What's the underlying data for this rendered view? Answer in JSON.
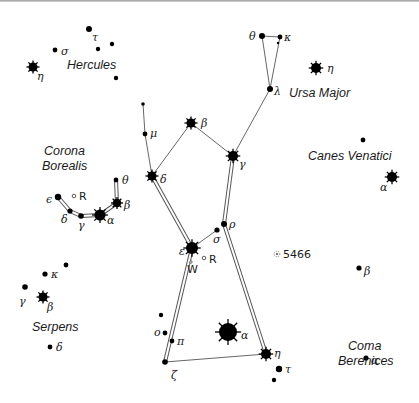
{
  "map": {
    "constellation_labels": [
      {
        "text": "Hercules",
        "x": 67,
        "y": 69
      },
      {
        "text": "Ursa Major",
        "x": 289,
        "y": 97
      },
      {
        "text": "Corona",
        "x": 44,
        "y": 155
      },
      {
        "text": "Borealis",
        "x": 42,
        "y": 170
      },
      {
        "text": "Canes Venatici",
        "x": 308,
        "y": 160
      },
      {
        "text": "Serpens",
        "x": 32,
        "y": 331
      },
      {
        "text": "Coma",
        "x": 348,
        "y": 350
      },
      {
        "text": "Berenices",
        "x": 338,
        "y": 365
      }
    ],
    "stars": [
      {
        "id": "her-tau",
        "x": 89,
        "y": 29,
        "r": 3,
        "label": "τ",
        "lx": 92,
        "ly": 41
      },
      {
        "id": "her-sigma",
        "x": 55,
        "y": 50,
        "r": 2.4,
        "label": "σ",
        "lx": 61,
        "ly": 55
      },
      {
        "id": "her-a",
        "x": 98,
        "y": 49,
        "r": 2.2,
        "label": "",
        "lx": 0,
        "ly": 0
      },
      {
        "id": "her-b",
        "x": 112,
        "y": 44,
        "r": 2.2,
        "label": "",
        "lx": 0,
        "ly": 0
      },
      {
        "id": "her-c",
        "x": 116,
        "y": 78,
        "r": 2.2,
        "label": "",
        "lx": 0,
        "ly": 0
      },
      {
        "id": "her-eta",
        "x": 33,
        "y": 67,
        "r": 4.5,
        "bright": true,
        "label": "η",
        "lx": 37,
        "ly": 80
      },
      {
        "id": "uma-theta",
        "x": 262,
        "y": 36,
        "r": 3,
        "label": "θ",
        "lx": 249,
        "ly": 40
      },
      {
        "id": "uma-kappa",
        "x": 280,
        "y": 37,
        "r": 2.4,
        "label": "κ",
        "lx": 284,
        "ly": 41
      },
      {
        "id": "uma-double",
        "x": 278,
        "y": 43,
        "r": 1.2,
        "label": "",
        "lx": 0,
        "ly": 0
      },
      {
        "id": "uma-lambda",
        "x": 270,
        "y": 89,
        "r": 3,
        "label": "λ",
        "lx": 274,
        "ly": 95
      },
      {
        "id": "uma-eta",
        "x": 316,
        "y": 68,
        "r": 5,
        "bright": true,
        "label": "η",
        "lx": 327,
        "ly": 72
      },
      {
        "id": "boo-top",
        "x": 143,
        "y": 104,
        "r": 1.8,
        "label": "",
        "lx": 0,
        "ly": 0
      },
      {
        "id": "boo-mu",
        "x": 145,
        "y": 134,
        "r": 2.4,
        "label": "μ",
        "lx": 150,
        "ly": 137
      },
      {
        "id": "boo-beta",
        "x": 191,
        "y": 123,
        "r": 4.5,
        "bright": true,
        "label": "β",
        "lx": 201,
        "ly": 127
      },
      {
        "id": "boo-gamma",
        "x": 233,
        "y": 156,
        "r": 5,
        "bright": true,
        "label": "γ",
        "lx": 239,
        "ly": 168
      },
      {
        "id": "boo-delta",
        "x": 152,
        "y": 176,
        "r": 4.5,
        "bright": true,
        "label": "δ",
        "lx": 160,
        "ly": 183
      },
      {
        "id": "boo-rho",
        "x": 224,
        "y": 224,
        "r": 3,
        "label": "ρ",
        "lx": 229,
        "ly": 228
      },
      {
        "id": "boo-sigma",
        "x": 217,
        "y": 230,
        "r": 2.6,
        "label": "σ",
        "lx": 213,
        "ly": 243
      },
      {
        "id": "boo-epsilon",
        "x": 192,
        "y": 248,
        "r": 6,
        "bright": true,
        "label": "ε",
        "lx": 179,
        "ly": 255
      },
      {
        "id": "boo-omicron",
        "x": 165,
        "y": 333,
        "r": 2.4,
        "label": "ο",
        "lx": 154,
        "ly": 336
      },
      {
        "id": "boo-pi",
        "x": 172,
        "y": 341,
        "r": 2.4,
        "label": "π",
        "lx": 177,
        "ly": 345
      },
      {
        "id": "boo-x",
        "x": 161,
        "y": 315,
        "r": 2.2,
        "label": "",
        "lx": 0,
        "ly": 0
      },
      {
        "id": "boo-zeta",
        "x": 165,
        "y": 362,
        "r": 2.8,
        "label": "ζ",
        "lx": 171,
        "ly": 379
      },
      {
        "id": "boo-alpha",
        "x": 228,
        "y": 332,
        "r": 9,
        "bright": true,
        "label": "α",
        "lx": 241,
        "ly": 339
      },
      {
        "id": "boo-eta",
        "x": 266,
        "y": 354,
        "r": 5,
        "bright": true,
        "label": "η",
        "lx": 274,
        "ly": 357
      },
      {
        "id": "boo-tau",
        "x": 279,
        "y": 369,
        "r": 3.2,
        "label": "τ",
        "lx": 285,
        "ly": 373
      },
      {
        "id": "boo-upsilon",
        "x": 274,
        "y": 380,
        "r": 2.2,
        "label": "",
        "lx": 0,
        "ly": 0
      },
      {
        "id": "crb-theta",
        "x": 116,
        "y": 180,
        "r": 2.4,
        "label": "θ",
        "lx": 122,
        "ly": 184
      },
      {
        "id": "crb-beta",
        "x": 117,
        "y": 203,
        "r": 4.2,
        "bright": true,
        "label": "β",
        "lx": 124,
        "ly": 209
      },
      {
        "id": "crb-alpha",
        "x": 100,
        "y": 215,
        "r": 5.5,
        "bright": true,
        "label": "α",
        "lx": 107,
        "ly": 224
      },
      {
        "id": "crb-gamma",
        "x": 81,
        "y": 216,
        "r": 2.8,
        "label": "γ",
        "lx": 78,
        "ly": 229
      },
      {
        "id": "crb-delta",
        "x": 70,
        "y": 211,
        "r": 2.6,
        "label": "δ",
        "lx": 61,
        "ly": 223
      },
      {
        "id": "crb-epsilon",
        "x": 58,
        "y": 197,
        "r": 3.2,
        "label": "ϵ",
        "lx": 46,
        "ly": 203
      },
      {
        "id": "cvn-top",
        "x": 363,
        "y": 140,
        "r": 2.4,
        "label": "",
        "lx": 0,
        "ly": 0
      },
      {
        "id": "cvn-alpha",
        "x": 392,
        "y": 177,
        "r": 5,
        "bright": true,
        "label": "α",
        "lx": 380,
        "ly": 191
      },
      {
        "id": "com-beta",
        "x": 359,
        "y": 268,
        "r": 2.6,
        "label": "β",
        "lx": 364,
        "ly": 275
      },
      {
        "id": "com-alpha",
        "x": 366,
        "y": 358,
        "r": 2.6,
        "label": "α",
        "lx": 371,
        "ly": 364
      },
      {
        "id": "ser-a",
        "x": 66,
        "y": 265,
        "r": 2.4,
        "label": "",
        "lx": 0,
        "ly": 0
      },
      {
        "id": "ser-kappa",
        "x": 45,
        "y": 274,
        "r": 2.6,
        "label": "κ",
        "lx": 51,
        "ly": 278
      },
      {
        "id": "ser-gamma",
        "x": 25,
        "y": 287,
        "r": 2.8,
        "label": "γ",
        "lx": 19,
        "ly": 305
      },
      {
        "id": "ser-beta",
        "x": 43,
        "y": 297,
        "r": 4.5,
        "bright": true,
        "label": "β",
        "lx": 47,
        "ly": 311
      },
      {
        "id": "ser-delta",
        "x": 50,
        "y": 347,
        "r": 2.4,
        "label": "δ",
        "lx": 56,
        "ly": 351
      }
    ],
    "single_lines": [
      [
        262,
        36,
        280,
        37
      ],
      [
        262,
        36,
        270,
        89
      ],
      [
        280,
        37,
        270,
        89
      ],
      [
        270,
        89,
        233,
        156
      ],
      [
        143,
        104,
        145,
        134
      ],
      [
        145,
        134,
        152,
        176
      ],
      [
        152,
        176,
        191,
        123
      ],
      [
        191,
        123,
        233,
        156
      ],
      [
        192,
        248,
        217,
        230
      ],
      [
        165,
        362,
        266,
        354
      ]
    ],
    "double_lines": [
      [
        152,
        176,
        192,
        248
      ],
      [
        233,
        156,
        224,
        224
      ],
      [
        224,
        224,
        266,
        354
      ],
      [
        192,
        248,
        165,
        362
      ],
      [
        116,
        180,
        117,
        203
      ],
      [
        117,
        203,
        100,
        215
      ],
      [
        100,
        215,
        81,
        216
      ],
      [
        81,
        216,
        70,
        211
      ],
      [
        70,
        211,
        58,
        197
      ]
    ],
    "variable_stars": [
      {
        "label": "R",
        "x": 74,
        "y": 196,
        "lx": 79,
        "ly": 200
      },
      {
        "label": "R",
        "x": 204,
        "y": 258,
        "lx": 209,
        "ly": 263
      }
    ],
    "variable_star_w": {
      "label": "W",
      "x": 191,
      "y": 266
    },
    "deep_sky": [
      {
        "label": "5466",
        "x": 277,
        "y": 254,
        "lx": 283,
        "ly": 258
      }
    ]
  }
}
